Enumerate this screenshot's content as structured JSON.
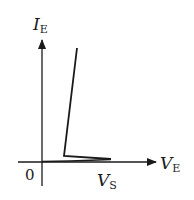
{
  "diagram": {
    "y_axis": {
      "label_main": "I",
      "label_sub": "E"
    },
    "x_axis": {
      "label_main": "V",
      "label_sub": "E"
    },
    "origin_label": "0",
    "marker": {
      "label_main": "V",
      "label_sub": "S"
    },
    "colors": {
      "stroke": "#1a1a1a",
      "background": "#ffffff"
    }
  }
}
